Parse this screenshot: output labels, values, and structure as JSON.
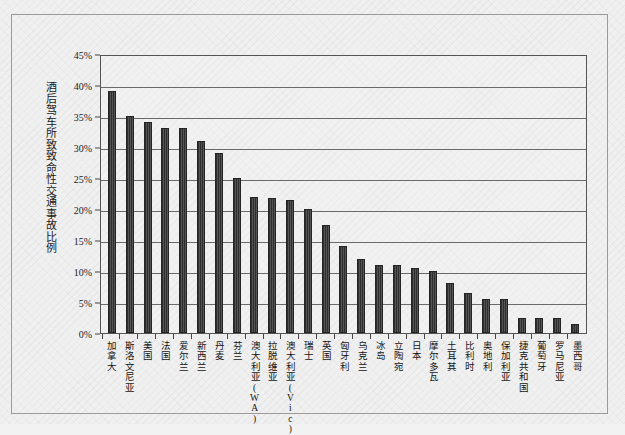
{
  "chart_data": {
    "type": "bar",
    "title": "",
    "subtitle": "",
    "xlabel": "",
    "ylabel": "酒后驾车所致致命性交通事故比例",
    "ylim": [
      0,
      45
    ],
    "ytick_labels": [
      "45%",
      "40%",
      "35%",
      "30%",
      "25%",
      "20%",
      "15%",
      "10%",
      "5%",
      "0%"
    ],
    "ytick_values": [
      45,
      40,
      35,
      30,
      25,
      20,
      15,
      10,
      5,
      0
    ],
    "grid": true,
    "legend": "none",
    "orientation": "vertical",
    "bar_color": "#3a3a3a",
    "categories": [
      "加拿大",
      "斯洛文尼亚",
      "美国",
      "法国",
      "爱尔兰",
      "新西兰",
      "丹麦",
      "芬兰",
      "澳大利亚(WA)",
      "拉脱维亚",
      "澳大利亚(Vic)",
      "瑞士",
      "英国",
      "匈牙利",
      "乌克兰",
      "冰岛",
      "立陶宛",
      "日本",
      "摩尔多瓦",
      "土耳其",
      "比利时",
      "奥地利",
      "保加利亚",
      "捷克共和国",
      "葡萄牙",
      "罗马尼亚",
      "墨西哥"
    ],
    "values": [
      39.0,
      35.0,
      34.0,
      33.0,
      33.0,
      31.0,
      29.0,
      25.0,
      22.0,
      21.8,
      21.5,
      20.0,
      17.5,
      14.0,
      12.0,
      11.0,
      11.0,
      10.5,
      10.0,
      8.0,
      6.5,
      5.5,
      5.5,
      2.5,
      2.5,
      2.5,
      1.5
    ]
  },
  "figure": {
    "frame_color": "#9a9a9a",
    "background_color": "#f0f0f0",
    "axis_color": "#555555",
    "gridline_color": "#6a6a6a"
  }
}
